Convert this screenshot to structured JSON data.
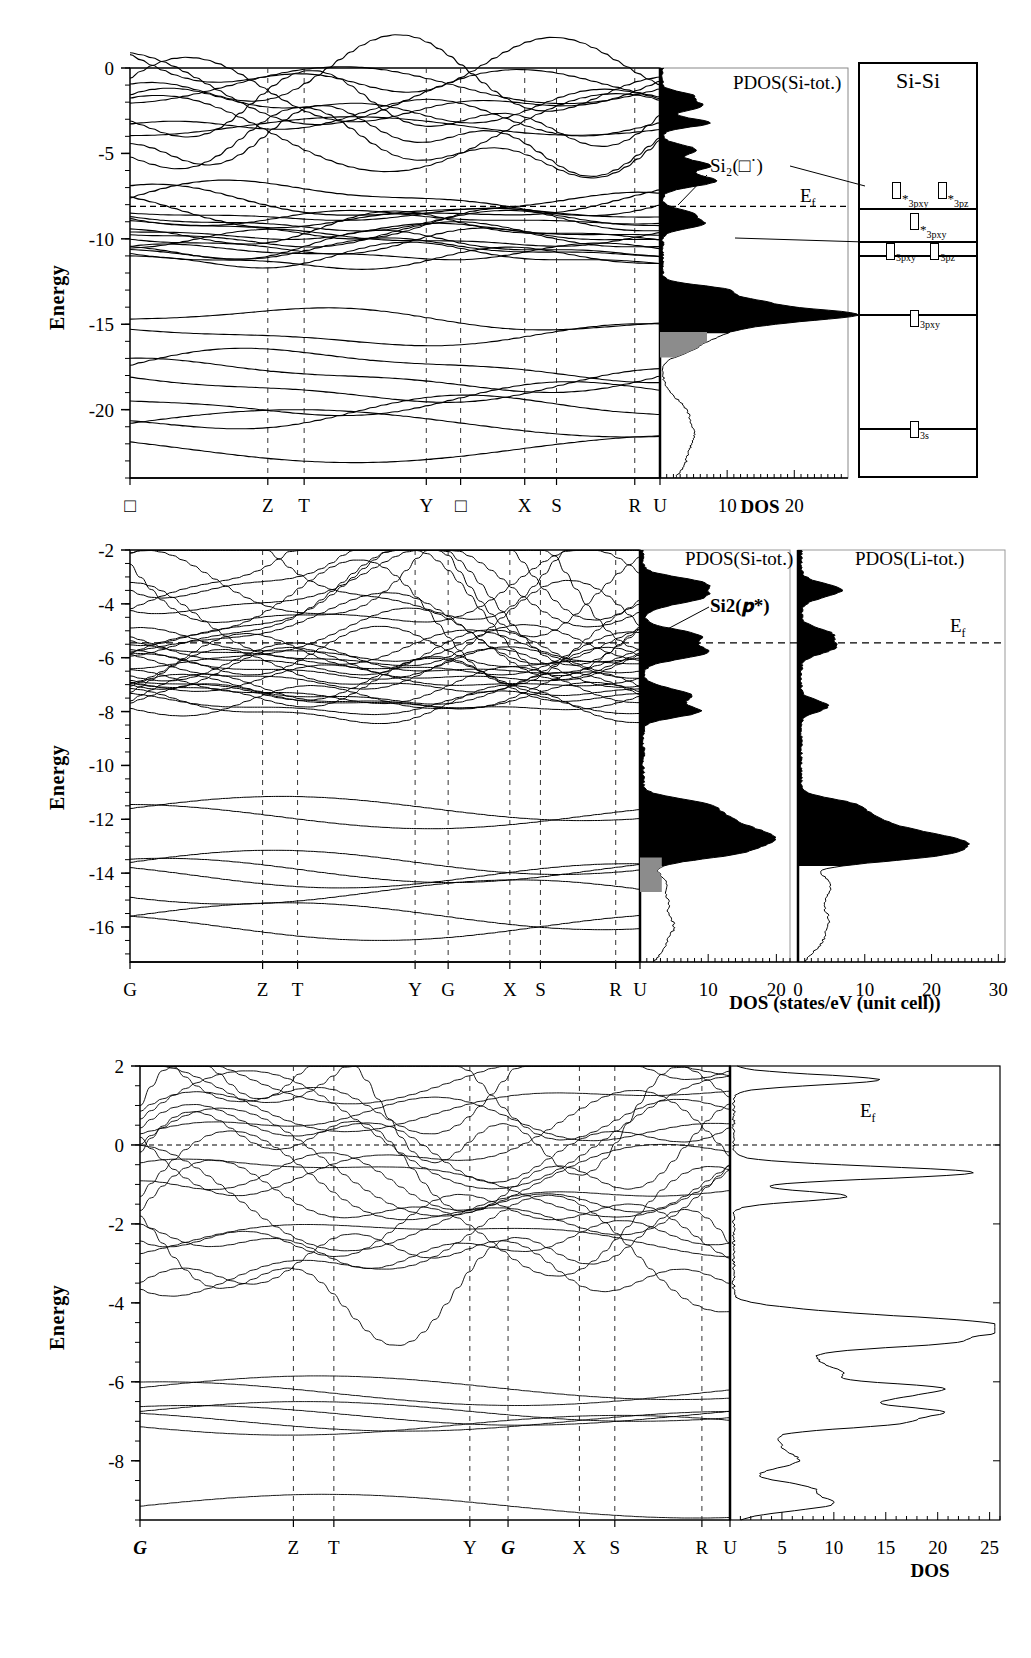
{
  "figure": {
    "type": "band-structure-dos",
    "panels": 3
  },
  "panel1": {
    "ylabel": "Energy",
    "yticks": [
      "0",
      "-5",
      "-10",
      "-15",
      "-20"
    ],
    "yvalues": [
      0,
      -5,
      -10,
      -15,
      -20
    ],
    "ylim": [
      -24,
      0
    ],
    "kpoints": [
      "□",
      "Z",
      "T",
      "Y",
      "□",
      "X",
      "S",
      "R",
      "U"
    ],
    "kpositions": [
      0.0,
      0.273,
      0.345,
      0.587,
      0.655,
      0.782,
      0.845,
      1.0,
      1.05
    ],
    "dos_label": "PDOS(Si-tot.)",
    "dos_ticks": [
      "10",
      "20"
    ],
    "dos_tick_values": [
      10,
      20
    ],
    "dos_axis_title": "DOS",
    "dos_xlim": [
      0,
      28
    ],
    "fermi_label": "E",
    "fermi_sub": "f",
    "fermi_energy": -8.1,
    "annotation": "Si₂(□˙)",
    "levels_title": "Si-Si",
    "levels": [
      {
        "label": "□",
        "star": true,
        "sub": "3pxy",
        "y": -7.8,
        "x": 0.3
      },
      {
        "label": "□",
        "star": true,
        "sub": "3pz",
        "y": -7.8,
        "x": 0.68
      },
      {
        "label": "□",
        "star": true,
        "sub": "3pxy",
        "y": -9.6,
        "x": 0.45
      },
      {
        "label": "□",
        "star": false,
        "sub": "3pxy",
        "y": -11.3,
        "x": 0.25
      },
      {
        "label": "□",
        "star": false,
        "sub": "3pz",
        "y": -11.3,
        "x": 0.62
      },
      {
        "label": "□",
        "star": false,
        "sub": "3pxy",
        "y": -15.2,
        "x": 0.45
      },
      {
        "label": "□",
        "star": false,
        "sub": "3s",
        "y": -21.6,
        "x": 0.45
      }
    ],
    "level_dividers": [
      -8.3,
      -10.2,
      -11.0,
      -14.4,
      -21.0
    ]
  },
  "panel2": {
    "ylabel": "Energy",
    "yticks": [
      "-2",
      "-4",
      "-6",
      "-8",
      "-10",
      "-12",
      "-14",
      "-16"
    ],
    "yvalues": [
      -2,
      -4,
      -6,
      -8,
      -10,
      -12,
      -14,
      -16
    ],
    "ylim": [
      -17.3,
      -2
    ],
    "kpoints": [
      "G",
      "Z",
      "T",
      "Y",
      "G",
      "X",
      "S",
      "R",
      "U"
    ],
    "kpositions": [
      0.0,
      0.273,
      0.345,
      0.587,
      0.655,
      0.782,
      0.845,
      1.0,
      1.05
    ],
    "dos_left_label": "PDOS(Si-tot.)",
    "dos_right_label": "PDOS(Li-tot.)",
    "dos_left_ticks": [
      "10",
      "20"
    ],
    "dos_left_tick_values": [
      10,
      20
    ],
    "dos_right_ticks": [
      "0",
      "10",
      "20",
      "30"
    ],
    "dos_right_tick_values": [
      0,
      10,
      20,
      30
    ],
    "dos_axis_title": "DOS (states/eV (unit cell))",
    "fermi_label": "E",
    "fermi_sub": "f",
    "fermi_energy": -5.45,
    "annotation": "Si2(𝒑*)"
  },
  "panel3": {
    "ylabel": "Energy",
    "yticks": [
      "2",
      "0",
      "-2",
      "-4",
      "-6",
      "-8"
    ],
    "yvalues": [
      2,
      0,
      -2,
      -4,
      -6,
      -8
    ],
    "ylim": [
      -9.5,
      2
    ],
    "kpoints": [
      "G",
      "Z",
      "T",
      "Y",
      "G",
      "X",
      "S",
      "R",
      "U"
    ],
    "kpositions": [
      0.0,
      0.273,
      0.345,
      0.587,
      0.655,
      0.782,
      0.845,
      1.0,
      1.05
    ],
    "dos_ticks": [
      "5",
      "10",
      "15",
      "20",
      "25"
    ],
    "dos_tick_values": [
      5,
      10,
      15,
      20,
      25
    ],
    "dos_axis_title": "DOS",
    "dos_xlim": [
      0,
      26
    ],
    "fermi_label": "E",
    "fermi_sub": "f",
    "fermi_energy": 0.0
  },
  "colors": {
    "line": "#000000",
    "fill_dark": "#000000",
    "fill_gray": "#8c8c8c",
    "grid": "#333333"
  }
}
